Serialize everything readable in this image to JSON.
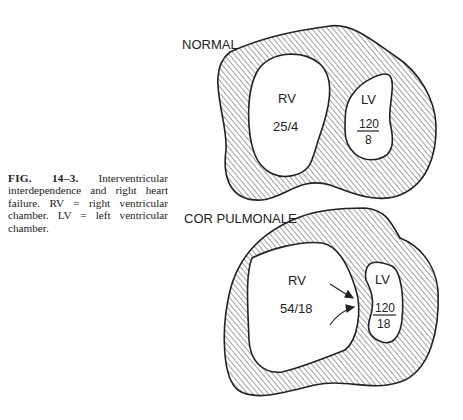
{
  "figure": {
    "label": "FIG. 14–3.",
    "caption": "Interventricular interdependence and right heart failure. RV = right ventricular chamber. LV = left ventricular chamber."
  },
  "panels": [
    {
      "title": "NORMAL",
      "rv": {
        "label": "RV",
        "pressure": "25/4"
      },
      "lv": {
        "label": "LV",
        "systolic": "120",
        "diastolic": "8"
      }
    },
    {
      "title": "COR PULMONALE",
      "rv": {
        "label": "RV",
        "pressure": "54/18"
      },
      "lv": {
        "label": "LV",
        "systolic": "120",
        "diastolic": "18"
      }
    }
  ],
  "colors": {
    "ink": "#222222",
    "background": "#ffffff"
  }
}
